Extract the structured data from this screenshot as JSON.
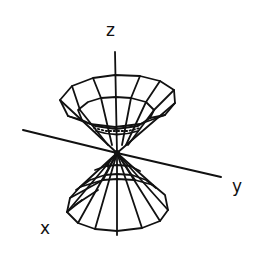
{
  "figure": {
    "type": "3D double cone (x^2 + y^2 = z^2) wireframe",
    "stroke_color": "#111111",
    "background": "#ffffff",
    "axes": {
      "z": {
        "label": "z"
      },
      "y": {
        "label": "y"
      },
      "x": {
        "label": "x"
      }
    }
  }
}
